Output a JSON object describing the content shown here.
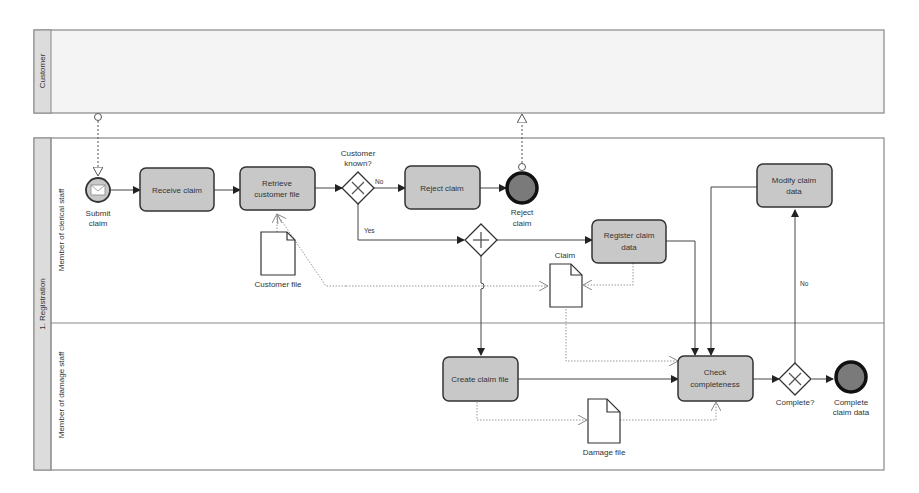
{
  "pools": {
    "customer": {
      "label": "Customer"
    },
    "registration": {
      "label": "1. Registration",
      "lanes": [
        {
          "label": "Member of clerical staff"
        },
        {
          "label": "Member of damage staff"
        }
      ]
    }
  },
  "events": {
    "start": {
      "label_line1": "Submit",
      "label_line2": "claim",
      "icon": "envelope-icon"
    },
    "end_reject": {
      "label_line1": "Reject",
      "label_line2": "claim"
    },
    "end_complete": {
      "label_line1": "Complete",
      "label_line2": "claim data"
    }
  },
  "tasks": {
    "receive_claim": {
      "line1": "Receive claim"
    },
    "retrieve_customer_file": {
      "line1": "Retrieve",
      "line2": "customer file"
    },
    "reject_claim": {
      "line1": "Reject claim"
    },
    "register_claim_data": {
      "line1": "Register claim",
      "line2": "data"
    },
    "modify_claim_data": {
      "line1": "Modify claim",
      "line2": "data"
    },
    "create_claim_file": {
      "line1": "Create claim file"
    },
    "check_completeness": {
      "line1": "Check",
      "line2": "completeness"
    }
  },
  "gateways": {
    "customer_known": {
      "label_line1": "Customer",
      "label_line2": "known?",
      "type": "exclusive"
    },
    "parallel": {
      "type": "parallel"
    },
    "complete": {
      "label": "Complete?",
      "type": "exclusive"
    }
  },
  "flow_labels": {
    "no1": "No",
    "yes": "Yes",
    "no2": "No"
  },
  "data_objects": {
    "customer_file": {
      "label": "Customer file"
    },
    "claim": {
      "label": "Claim"
    },
    "damage_file": {
      "label": "Damage file"
    }
  },
  "colors": {
    "task_fill": "#c8c8c8",
    "end_fill": "#7a7a7a",
    "pool_header": "#dcdcdc",
    "pool_bg": "#f4f4f4",
    "line": "#444444",
    "dotted": "#999999"
  }
}
